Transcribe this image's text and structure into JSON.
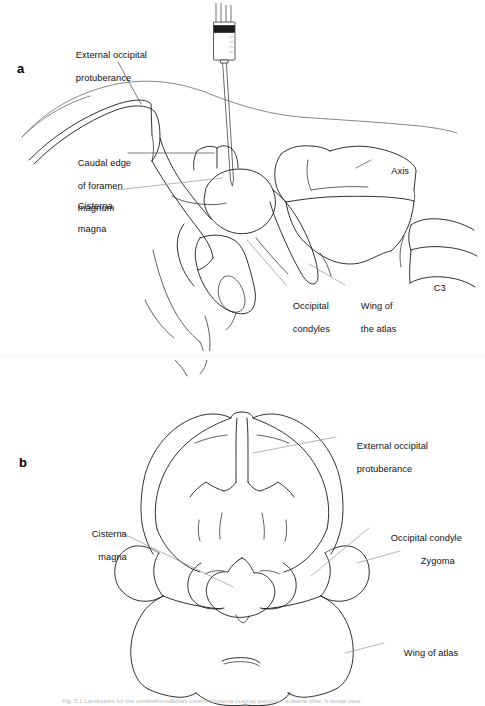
{
  "figure": {
    "background_color": "#ffffff",
    "ink_color": "#1a1a1a",
    "leader_color": "#8a8a8a",
    "caption_prefix": "Fig. 5.1",
    "caption_text": "Fig. 5.1  Landmarks for the cerebellomedullary cistern (cisterna magna) puncture: a lateral view, b dorsal view"
  },
  "panel_a": {
    "letter": "a",
    "labels": [
      {
        "id": "external-occipital-protuberance",
        "line1": "External occipital",
        "line2": "protuberance"
      },
      {
        "id": "caudal-edge-of-foramen-magnum",
        "line1": "Caudal edge",
        "line2": "of foramen",
        "line3": "magnum"
      },
      {
        "id": "cisterna-magna",
        "line1": "Cisterna",
        "line2": "magna"
      },
      {
        "id": "axis",
        "line1": "Axis"
      },
      {
        "id": "c3",
        "line1": "C3"
      },
      {
        "id": "occipital-condyles",
        "line1": "Occipital",
        "line2": "condyles"
      },
      {
        "id": "wing-of-the-atlas",
        "line1": "Wing of",
        "line2": "the atlas"
      }
    ],
    "instrument": "syringe-with-needle"
  },
  "panel_b": {
    "letter": "b",
    "labels": [
      {
        "id": "external-occipital-protuberance",
        "line1": "External occipital",
        "line2": "protuberance"
      },
      {
        "id": "cisterna-magna",
        "line1": "Cisterna",
        "line2": "magna"
      },
      {
        "id": "occipital-condyle",
        "line1": "Occipital condyle"
      },
      {
        "id": "zygoma",
        "line1": "Zygoma"
      },
      {
        "id": "wing-of-atlas",
        "line1": "Wing of atlas"
      }
    ]
  }
}
